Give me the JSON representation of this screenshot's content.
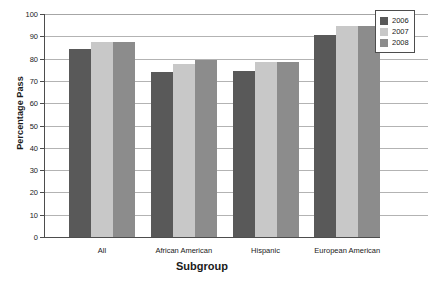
{
  "chart_data": {
    "type": "bar",
    "title": "",
    "xlabel": "Subgroup",
    "ylabel": "Percentage Pass",
    "categories": [
      "All",
      "African American",
      "Hispanic",
      "European American"
    ],
    "series": [
      {
        "name": "2006",
        "color": "#595959",
        "values": [
          84.5,
          74,
          74.5,
          90.5
        ]
      },
      {
        "name": "2007",
        "color": "#c8c8c8",
        "values": [
          87.5,
          77.5,
          78.5,
          94.5
        ]
      },
      {
        "name": "2008",
        "color": "#8c8c8c",
        "values": [
          87.5,
          79.5,
          78.5,
          94.5
        ]
      }
    ],
    "ylim": [
      0,
      100
    ],
    "yticks": [
      0,
      10,
      20,
      30,
      40,
      50,
      60,
      70,
      80,
      90,
      100
    ],
    "ytick_labels": [
      "0",
      "10",
      "20",
      "30",
      "40",
      "50",
      "60",
      "70",
      "80",
      "90",
      "100"
    ],
    "grid": true,
    "legend_position": "top-right"
  }
}
